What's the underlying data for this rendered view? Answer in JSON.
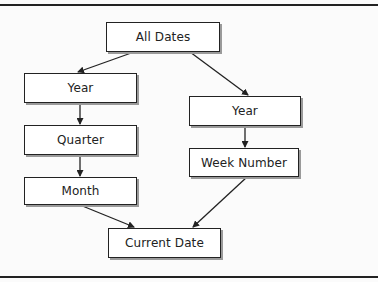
{
  "diagram": {
    "type": "hierarchy",
    "nodes": {
      "all_dates": {
        "label": "All Dates"
      },
      "year_left": {
        "label": "Year"
      },
      "quarter": {
        "label": "Quarter"
      },
      "month": {
        "label": "Month"
      },
      "year_right": {
        "label": "Year"
      },
      "week_number": {
        "label": "Week Number"
      },
      "current_date": {
        "label": "Current Date"
      }
    },
    "edges": [
      {
        "from": "All Dates",
        "to": "Year (left)"
      },
      {
        "from": "All Dates",
        "to": "Year (right)"
      },
      {
        "from": "Year (left)",
        "to": "Quarter"
      },
      {
        "from": "Quarter",
        "to": "Month"
      },
      {
        "from": "Month",
        "to": "Current Date"
      },
      {
        "from": "Year (right)",
        "to": "Week Number"
      },
      {
        "from": "Week Number",
        "to": "Current Date"
      }
    ],
    "colors": {
      "line": "#222222",
      "box_fill": "#ffffff",
      "shadow": "#9a9a9a"
    }
  }
}
